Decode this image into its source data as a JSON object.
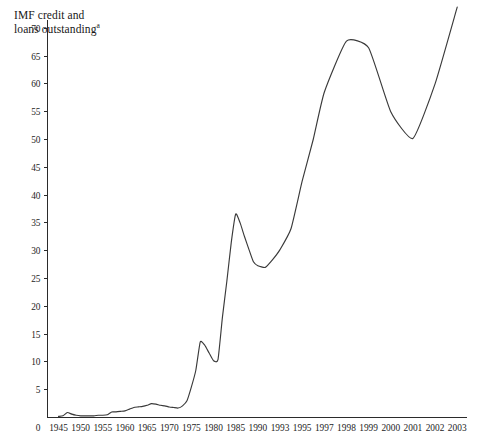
{
  "chart_title": {
    "line1": "IMF credit and",
    "line2": "loans outstanding",
    "superscript": "a"
  },
  "chart_data": {
    "type": "line",
    "title": "IMF credit and loans outstanding",
    "title_superscript": "a",
    "xlabel": "",
    "ylabel": "",
    "ylim": [
      0,
      74
    ],
    "y_ticks": [
      0,
      5,
      10,
      15,
      20,
      25,
      30,
      35,
      40,
      45,
      50,
      55,
      60,
      65,
      70
    ],
    "y_tick_labels": [
      "0",
      "5",
      "10",
      "15",
      "20",
      "25",
      "30",
      "35",
      "40",
      "45",
      "50",
      "55",
      "60",
      "65",
      "70"
    ],
    "grid": false,
    "legend": false,
    "axis_type": "categorical",
    "x_tick_labels": [
      "1945",
      "1950",
      "1955",
      "1960",
      "1965",
      "1970",
      "1975",
      "1980",
      "1985",
      "1990",
      "1993",
      "1995",
      "1997",
      "1998",
      "1999",
      "2000",
      "2001",
      "2002",
      "2003"
    ],
    "zero_origin_label": "0",
    "series": [
      {
        "name": "IMF credit and loans outstanding",
        "color": "#3a3a3a",
        "x": [
          "1945",
          "1946",
          "1947",
          "1948",
          "1949",
          "1950",
          "1951",
          "1952",
          "1953",
          "1954",
          "1955",
          "1956",
          "1957",
          "1958",
          "1959",
          "1960",
          "1961",
          "1962",
          "1963",
          "1964",
          "1965",
          "1966",
          "1967",
          "1968",
          "1969",
          "1970",
          "1971",
          "1972",
          "1973",
          "1974",
          "1975",
          "1976",
          "1977",
          "1978",
          "1979",
          "1980",
          "1981",
          "1982",
          "1983",
          "1984",
          "1985",
          "1986",
          "1987",
          "1988",
          "1989",
          "1990",
          "1991",
          "1992",
          "1993",
          "1994",
          "1995",
          "1996",
          "1997",
          "1998",
          "1999",
          "2000",
          "2001",
          "2002",
          "2003"
        ],
        "values": [
          0.2,
          0.3,
          0.9,
          0.6,
          0.4,
          0.3,
          0.3,
          0.3,
          0.3,
          0.4,
          0.4,
          0.5,
          1.0,
          1.0,
          1.1,
          1.2,
          1.5,
          1.8,
          1.9,
          2.0,
          2.2,
          2.5,
          2.4,
          2.2,
          2.1,
          1.9,
          1.8,
          1.7,
          2.1,
          3.0,
          5.5,
          8.5,
          13.6,
          13.0,
          11.6,
          10.2,
          10.4,
          18.0,
          24.5,
          31.5,
          36.6,
          35.0,
          32.5,
          30.2,
          28.0,
          27.3,
          27.0,
          28.4,
          30.2,
          34.0,
          42.5,
          50.0,
          58.5,
          67.7,
          66.5,
          55.0,
          50.2,
          60.0,
          73.8
        ]
      }
    ],
    "annotations": []
  }
}
